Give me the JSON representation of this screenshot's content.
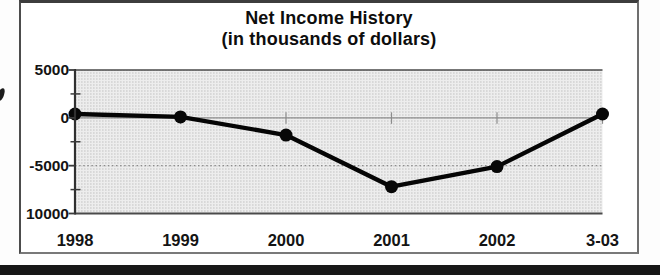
{
  "page": {
    "background": "#ffffff",
    "bottom_bar_color": "#161616",
    "frame_border_color": "#4c4c4c"
  },
  "chart": {
    "title_line1": "Net Income History",
    "title_line2": "(in thousands of dollars)"
  },
  "chart_data": {
    "type": "line",
    "title": "Net Income History (in thousands of dollars)",
    "xlabel": "",
    "ylabel": "",
    "categories": [
      "1998",
      "1999",
      "2000",
      "2001",
      "2002",
      "3-03"
    ],
    "values": [
      400,
      100,
      -1800,
      -7200,
      -5100,
      400
    ],
    "ylim": [
      -10000,
      5000
    ],
    "y_ticks": [
      {
        "value": 5000,
        "label": "5000"
      },
      {
        "value": 0,
        "label": "0"
      },
      {
        "value": -5000,
        "label": "-5000"
      },
      {
        "value": -10000,
        "label": "10000"
      }
    ],
    "y_minor_ticks": [
      2500,
      -2500,
      -7500
    ],
    "gridlines": {
      "solid_at": 0,
      "dotted_at": -5000
    },
    "legend": "none",
    "line_color": "#050505",
    "marker": "filled-circle",
    "plot_bg": "stippled-light-gray",
    "plot_bg_color": "#ededed"
  }
}
